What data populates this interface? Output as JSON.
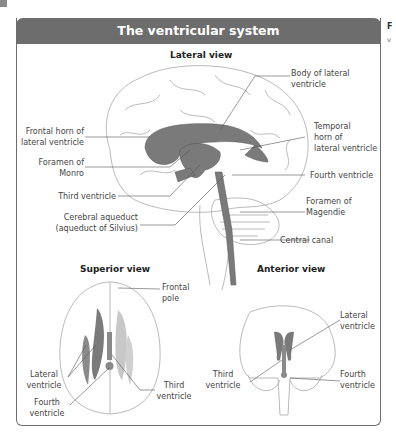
{
  "panel": {
    "title": "The ventricular system",
    "side_label_initial": "F",
    "side_label_second": "v"
  },
  "lateral_view": {
    "heading": "Lateral view",
    "labels": {
      "frontal_horn": [
        "Frontal horn of",
        "lateral ventricle"
      ],
      "foramen_monro": [
        "Foramen of",
        "Monro"
      ],
      "third_ventricle": "Third ventricle",
      "cerebral_aqueduct": [
        "Cerebral aqueduct",
        "(aqueduct of Silvius)"
      ],
      "body_lateral": [
        "Body of lateral",
        "ventricle"
      ],
      "temporal_horn": [
        "Temporal",
        "horn of",
        "lateral ventricle"
      ],
      "fourth_ventricle": "Fourth ventricle",
      "foramen_magendie": [
        "Foramen of",
        "Magendie"
      ],
      "central_canal": "Central canal"
    }
  },
  "superior_view": {
    "heading": "Superior view",
    "labels": {
      "frontal_pole": [
        "Frontal",
        "pole"
      ],
      "lateral_ventricle": [
        "Lateral",
        "ventricle"
      ],
      "third_ventricle": [
        "Third",
        "ventricle"
      ],
      "fourth_ventricle": [
        "Fourth",
        "ventricle"
      ]
    }
  },
  "anterior_view": {
    "heading": "Anterior view",
    "labels": {
      "lateral_ventricle": [
        "Lateral",
        "ventricle"
      ],
      "third_ventricle": [
        "Third",
        "ventricle"
      ],
      "fourth_ventricle": [
        "Fourth",
        "ventricle"
      ]
    }
  },
  "colors": {
    "header_bg": "#6d6d6d",
    "ventricle_fill": "#7a7a7a",
    "ventricle_light": "#c8c8c8",
    "outline": "#9a9a9a"
  }
}
